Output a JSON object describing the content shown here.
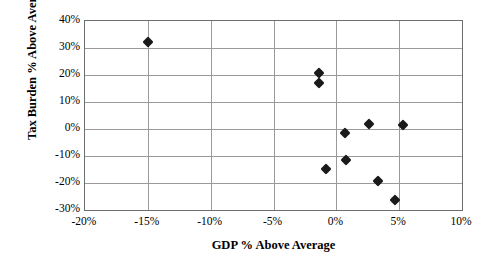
{
  "chart_data": {
    "type": "scatter",
    "title": "",
    "xlabel": "GDP % Above Average",
    "ylabel": "Tax Burden % Above Average",
    "xlim": [
      -0.2,
      0.1
    ],
    "ylim": [
      -0.3,
      0.4
    ],
    "xticks": [
      "-20%",
      "-15%",
      "-10%",
      "-5%",
      "0%",
      "5%",
      "10%"
    ],
    "xtick_values": [
      -0.2,
      -0.15,
      -0.1,
      -0.05,
      0.0,
      0.05,
      0.1
    ],
    "yticks": [
      "40%",
      "30%",
      "20%",
      "10%",
      "0%",
      "-10%",
      "-20%",
      "-30%"
    ],
    "ytick_values": [
      0.4,
      0.3,
      0.2,
      0.1,
      0.0,
      -0.1,
      -0.2,
      -0.3
    ],
    "grid": true,
    "legend": "none",
    "marker": "diamond",
    "marker_color": "#1a1a1a",
    "series": [
      {
        "name": "Countries",
        "points": [
          {
            "x": -0.15,
            "y": 0.322
          },
          {
            "x": -0.014,
            "y": 0.208
          },
          {
            "x": -0.014,
            "y": 0.17
          },
          {
            "x": -0.008,
            "y": -0.148
          },
          {
            "x": 0.007,
            "y": -0.015
          },
          {
            "x": 0.008,
            "y": -0.115
          },
          {
            "x": 0.026,
            "y": 0.017
          },
          {
            "x": 0.033,
            "y": -0.192
          },
          {
            "x": 0.047,
            "y": -0.263
          },
          {
            "x": 0.053,
            "y": 0.013
          }
        ]
      }
    ]
  }
}
